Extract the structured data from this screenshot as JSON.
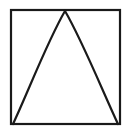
{
  "figure": {
    "type": "line-drawing",
    "background_color": "#ffffff",
    "stroke_color": "#1a1a1a",
    "canvas": {
      "width": 130,
      "height": 136
    },
    "frame": {
      "name": "square-border",
      "left": 11,
      "top": 10,
      "right": 120,
      "bottom": 124,
      "width": 109,
      "height": 114,
      "stroke_width": 2.2,
      "fill": "none"
    },
    "curve": {
      "name": "arch-curve",
      "shape": "parabolic-arch",
      "stroke_width": 2.2,
      "fill": "none",
      "apex": {
        "x": 65,
        "y": 11
      },
      "left_base": {
        "x": 13,
        "y": 124
      },
      "right_base": {
        "x": 118,
        "y": 124
      },
      "apex_style": "sharp-cusp",
      "symmetric": true,
      "path": "M 13 124 C 28 92 48 40 65 11 C 82 40 103 92 118 124",
      "sampled_points": [
        {
          "y": 11,
          "left_x": 65,
          "right_x": 65
        },
        {
          "y": 36,
          "left_x": 49,
          "right_x": 81
        },
        {
          "y": 67,
          "left_x": 35,
          "right_x": 95
        },
        {
          "y": 100,
          "left_x": 21,
          "right_x": 110
        },
        {
          "y": 124,
          "left_x": 13,
          "right_x": 118
        }
      ]
    }
  }
}
